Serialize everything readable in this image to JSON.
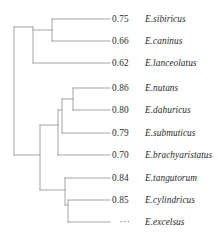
{
  "figure": {
    "type": "phylogenetic-tree",
    "orientation": "horizontal-right-facing",
    "background_color": "#ffffff",
    "branch_color": "#9a9a9a",
    "text_color": "#2b2b2b"
  },
  "leaves": [
    {
      "support": "0.75",
      "taxon": "E.sibiricus",
      "y": 19
    },
    {
      "support": "0.66",
      "taxon": "E.caninus",
      "y": 41
    },
    {
      "support": "0.62",
      "taxon": "E.lanceolatus",
      "y": 63
    },
    {
      "support": "0.86",
      "taxon": "E.nutans",
      "y": 88
    },
    {
      "support": "0.80",
      "taxon": "E.dahuricus",
      "y": 110
    },
    {
      "support": "0.79",
      "taxon": "E.submuticus",
      "y": 133
    },
    {
      "support": "0.70",
      "taxon": "E.brachyaristatus",
      "y": 155
    },
    {
      "support": "0.84",
      "taxon": "E.tangutorum",
      "y": 178
    },
    {
      "support": "0.85",
      "taxon": "E.cylindricus",
      "y": 200
    },
    {
      "support": "···",
      "taxon": "E.excelsus",
      "y": 222
    }
  ],
  "chart_data": {
    "type": "tree",
    "title": "",
    "xlabel": "",
    "ylabel": "",
    "tip_labels": [
      "E.sibiricus",
      "E.caninus",
      "E.lanceolatus",
      "E.nutans",
      "E.dahuricus",
      "E.submuticus",
      "E.brachyaristatus",
      "E.tangutorum",
      "E.cylindricus",
      "E.excelsus"
    ],
    "node_support_values": [
      "0.75",
      "0.66",
      "0.62",
      "0.86",
      "0.80",
      "0.79",
      "0.70",
      "0.84",
      "0.85",
      "···"
    ],
    "clades": [
      {
        "name": "top-clade",
        "members": [
          "E.sibiricus",
          "E.caninus",
          "E.lanceolatus"
        ]
      },
      {
        "name": "middle-clade",
        "members": [
          "E.nutans",
          "E.dahuricus",
          "E.submuticus",
          "E.brachyaristatus"
        ]
      },
      {
        "name": "bottom-clade",
        "members": [
          "E.tangutorum",
          "E.cylindricus",
          "E.excelsus"
        ]
      }
    ],
    "newick": "(((E.sibiricus,E.caninus),E.lanceolatus),((((E.nutans,E.dahuricus),E.submuticus),E.brachyaristatus),(E.tangutorum,(E.cylindricus,E.excelsus))));"
  },
  "branches": {
    "root_x": 14,
    "tip_x": 110,
    "segments": [
      {
        "name": "root-stem",
        "x1": 14,
        "y1": 27,
        "x2": 14,
        "y2": 155
      },
      {
        "name": "top-clade-stem",
        "x1": 14,
        "y1": 27,
        "x2": 33,
        "y2": 27
      },
      {
        "name": "top-clade-vertical",
        "x1": 33,
        "y1": 27,
        "x2": 33,
        "y2": 63
      },
      {
        "name": "top-pair-stem",
        "x1": 33,
        "y1": 30,
        "x2": 52,
        "y2": 30
      },
      {
        "name": "top-pair-vertical",
        "x1": 52,
        "y1": 19,
        "x2": 52,
        "y2": 41
      },
      {
        "name": "tip-sibiricus",
        "x1": 52,
        "y1": 19,
        "x2": 110,
        "y2": 19
      },
      {
        "name": "tip-caninus",
        "x1": 52,
        "y1": 41,
        "x2": 110,
        "y2": 41
      },
      {
        "name": "tip-lanceolatus",
        "x1": 33,
        "y1": 63,
        "x2": 110,
        "y2": 63
      },
      {
        "name": "lower-group-stem",
        "x1": 14,
        "y1": 155,
        "x2": 40,
        "y2": 155
      },
      {
        "name": "lower-group-vertical",
        "x1": 40,
        "y1": 125,
        "x2": 40,
        "y2": 190
      },
      {
        "name": "middle-clade-stem",
        "x1": 40,
        "y1": 125,
        "x2": 58,
        "y2": 125
      },
      {
        "name": "middle-clade-vertical",
        "x1": 58,
        "y1": 110,
        "x2": 58,
        "y2": 155
      },
      {
        "name": "tip-brachyaristatus",
        "x1": 58,
        "y1": 155,
        "x2": 110,
        "y2": 155
      },
      {
        "name": "middle-inner-stem",
        "x1": 58,
        "y1": 110,
        "x2": 62,
        "y2": 110
      },
      {
        "name": "middle-inner-vertical",
        "x1": 62,
        "y1": 99,
        "x2": 62,
        "y2": 133
      },
      {
        "name": "tip-submuticus",
        "x1": 62,
        "y1": 133,
        "x2": 110,
        "y2": 133
      },
      {
        "name": "middle-pair-stem",
        "x1": 62,
        "y1": 99,
        "x2": 73,
        "y2": 99
      },
      {
        "name": "middle-pair-vertical",
        "x1": 73,
        "y1": 88,
        "x2": 73,
        "y2": 110
      },
      {
        "name": "tip-nutans",
        "x1": 73,
        "y1": 88,
        "x2": 110,
        "y2": 88
      },
      {
        "name": "tip-dahuricus",
        "x1": 73,
        "y1": 110,
        "x2": 110,
        "y2": 110
      },
      {
        "name": "bottom-clade-stem",
        "x1": 40,
        "y1": 190,
        "x2": 65,
        "y2": 190
      },
      {
        "name": "bottom-clade-vertical",
        "x1": 65,
        "y1": 178,
        "x2": 65,
        "y2": 205
      },
      {
        "name": "tip-tangutorum",
        "x1": 65,
        "y1": 178,
        "x2": 110,
        "y2": 178
      },
      {
        "name": "bottom-pair-stem",
        "x1": 65,
        "y1": 205,
        "x2": 68,
        "y2": 205
      },
      {
        "name": "bottom-pair-vertical",
        "x1": 68,
        "y1": 200,
        "x2": 68,
        "y2": 222
      },
      {
        "name": "tip-cylindricus",
        "x1": 68,
        "y1": 200,
        "x2": 110,
        "y2": 200
      },
      {
        "name": "tip-excelsus",
        "x1": 68,
        "y1": 222,
        "x2": 110,
        "y2": 222
      }
    ]
  }
}
